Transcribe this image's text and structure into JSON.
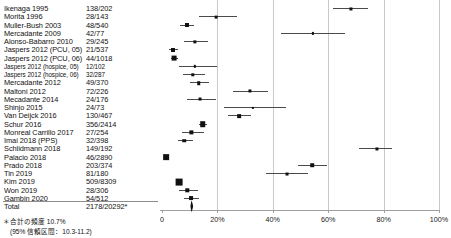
{
  "chart_data": {
    "type": "forest",
    "title": "",
    "xlabel": "",
    "ylabel": "",
    "xlim": [
      0,
      100
    ],
    "x_unit": "percent",
    "grid": true,
    "legend": "none",
    "axis": {
      "ticks": [
        0,
        20,
        40,
        60,
        80,
        100
      ],
      "tick_labels": [
        "0",
        "20%",
        "40%",
        "60%",
        "80%",
        "100%"
      ]
    },
    "columns": {
      "study": "",
      "count": ""
    },
    "rows": [
      {
        "study": "Ikenaga 1995",
        "count": "138/202",
        "estimate": 68.3,
        "ci_low": 61.8,
        "ci_high": 74.5,
        "weight": 2.0
      },
      {
        "study": "Morita 1996",
        "count": "28/143",
        "estimate": 19.6,
        "ci_low": 13.4,
        "ci_high": 26.9,
        "weight": 1.8
      },
      {
        "study": "Muller-Bush 2003",
        "count": "48/540",
        "estimate": 8.9,
        "ci_low": 6.6,
        "ci_high": 11.6,
        "weight": 2.6
      },
      {
        "study": "Mercadante 2009",
        "count": "42/77",
        "estimate": 54.5,
        "ci_low": 42.8,
        "ci_high": 65.9,
        "weight": 1.4
      },
      {
        "study": "Alonso-Babarro 2010",
        "count": "29/245",
        "estimate": 11.8,
        "ci_low": 8.1,
        "ci_high": 16.5,
        "weight": 2.1
      },
      {
        "study": "Jaspers 2012 (PCU, 05)",
        "count": "21/537",
        "estimate": 3.9,
        "ci_low": 2.4,
        "ci_high": 5.9,
        "weight": 2.6
      },
      {
        "study": "Jaspers 2012 (PCU, 06)",
        "count": "44/1018",
        "estimate": 4.3,
        "ci_low": 3.2,
        "ci_high": 5.8,
        "weight": 3.1
      },
      {
        "study": "Jaspers 2012 (hospice, 05)",
        "count": "12/102",
        "estimate": 11.8,
        "ci_low": 6.2,
        "ci_high": 19.7,
        "weight": 1.5
      },
      {
        "study": "Jaspers 2012 (hospice, 06)",
        "count": "32/287",
        "estimate": 11.1,
        "ci_low": 7.7,
        "ci_high": 15.4,
        "weight": 2.2
      },
      {
        "study": "Mercadante 2012",
        "count": "49/370",
        "estimate": 13.2,
        "ci_low": 10.0,
        "ci_high": 17.1,
        "weight": 2.3
      },
      {
        "study": "Maltoni 2012",
        "count": "72/226",
        "estimate": 31.9,
        "ci_low": 25.8,
        "ci_high": 38.4,
        "weight": 2.0
      },
      {
        "study": "Mecadante 2014",
        "count": "24/176",
        "estimate": 13.6,
        "ci_low": 8.9,
        "ci_high": 19.6,
        "weight": 1.9
      },
      {
        "study": "Shinjo 2015",
        "count": "24/73",
        "estimate": 32.9,
        "ci_low": 22.3,
        "ci_high": 44.9,
        "weight": 1.4
      },
      {
        "study": "Van Deijck 2016",
        "count": "130/467",
        "estimate": 27.8,
        "ci_low": 23.8,
        "ci_high": 32.2,
        "weight": 2.4
      },
      {
        "study": "Schur 2016",
        "count": "356/2414",
        "estimate": 14.7,
        "ci_low": 13.3,
        "ci_high": 16.2,
        "weight": 3.6
      },
      {
        "study": "Monreal Carrillo 2017",
        "count": "27/254",
        "estimate": 10.6,
        "ci_low": 7.1,
        "ci_high": 15.1,
        "weight": 2.1
      },
      {
        "study": "Imai 2018 (PPS)",
        "count": "32/398",
        "estimate": 8.0,
        "ci_low": 5.6,
        "ci_high": 11.1,
        "weight": 2.3
      },
      {
        "study": "Schlidmann 2018",
        "count": "149/192",
        "estimate": 77.6,
        "ci_low": 71.1,
        "ci_high": 83.2,
        "weight": 2.0
      },
      {
        "study": "Palacio 2018",
        "count": "46/2890",
        "estimate": 1.6,
        "ci_low": 1.2,
        "ci_high": 2.1,
        "weight": 3.7
      },
      {
        "study": "Prado 2018",
        "count": "203/374",
        "estimate": 54.3,
        "ci_low": 49.1,
        "ci_high": 59.4,
        "weight": 2.3
      },
      {
        "study": "Tin 2019",
        "count": "81/180",
        "estimate": 45.0,
        "ci_low": 37.6,
        "ci_high": 52.6,
        "weight": 1.9
      },
      {
        "study": "Kim 2019",
        "count": "509/8309",
        "estimate": 6.1,
        "ci_low": 5.6,
        "ci_high": 6.7,
        "weight": 4.4
      },
      {
        "study": "Won 2019",
        "count": "28/306",
        "estimate": 9.2,
        "ci_low": 6.2,
        "ci_high": 13.0,
        "weight": 2.2
      },
      {
        "study": "Gambin 2020",
        "count": "54/512",
        "estimate": 10.5,
        "ci_low": 8.0,
        "ci_high": 13.5,
        "weight": 2.5
      },
      {
        "study": "Total",
        "count": "2178/20292*",
        "estimate": 10.7,
        "ci_low": 10.3,
        "ci_high": 11.2,
        "weight": 0,
        "is_total": true
      }
    ],
    "summary": {
      "pooled_estimate": 10.7,
      "ci_low": 10.3,
      "ci_high": 11.2
    },
    "footnote": {
      "line1": "＊合計の頻度 10.7%",
      "line2": "(95% 信頼区間：10.3-11.2)"
    }
  }
}
